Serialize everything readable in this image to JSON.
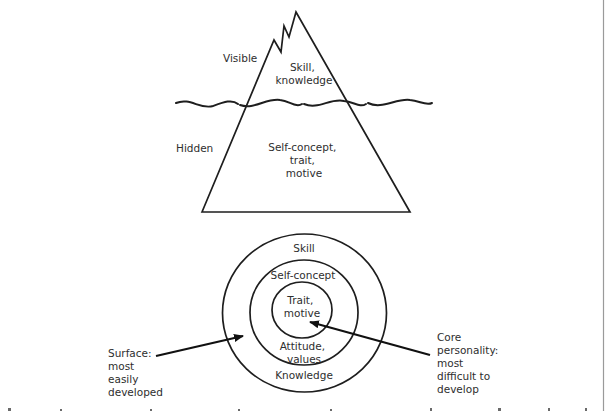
{
  "iceberg": {
    "label_visible": "Visible",
    "label_hidden": "Hidden",
    "above_water": [
      "Skill,",
      "knowledge"
    ],
    "below_water": [
      "Self-concept,",
      "trait,",
      "motive"
    ]
  },
  "circles": {
    "outer_top": "Skill",
    "outer_bottom": "Knowledge",
    "middle_top": "Self-concept",
    "middle_bottom": [
      "Attitude,",
      "values"
    ],
    "inner": [
      "Trait,",
      "motive"
    ]
  },
  "annotations": {
    "surface": [
      "Surface:",
      "most",
      "easily",
      "developed"
    ],
    "core": [
      "Core",
      "personality:",
      "most",
      "difficult to",
      "develop"
    ]
  },
  "colors": {
    "line": "#1e1e1e",
    "text": "#2e2e2e",
    "background": "#ffffff"
  }
}
